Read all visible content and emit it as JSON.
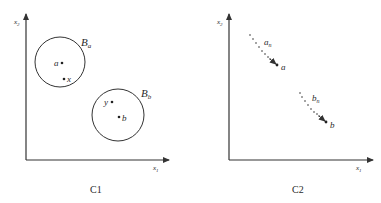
{
  "panels": [
    {
      "id": "C1",
      "caption": "C1",
      "axes": {
        "x_label": "x",
        "x_sub": "1",
        "y_label": "x",
        "y_sub": "2"
      },
      "balls": [
        {
          "label": "B",
          "sub": "a",
          "center_point": "a",
          "inner_point": "x"
        },
        {
          "label": "B",
          "sub": "b",
          "center_point": "b",
          "inner_point": "y"
        }
      ]
    },
    {
      "id": "C2",
      "caption": "C2",
      "axes": {
        "x_label": "x",
        "x_sub": "1",
        "y_label": "x",
        "y_sub": "2"
      },
      "sequences": [
        {
          "label": "a",
          "sub": "n",
          "limit": "a"
        },
        {
          "label": "b",
          "sub": "n",
          "limit": "b"
        }
      ]
    }
  ],
  "colors": {
    "stroke": "#333333",
    "background": "#ffffff"
  }
}
